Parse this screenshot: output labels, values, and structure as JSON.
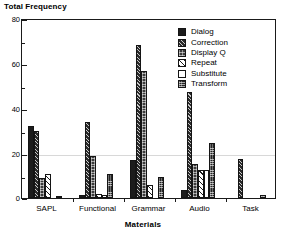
{
  "chart_data": {
    "type": "bar",
    "title": "Total Frequency",
    "subtitle": "",
    "xlabel": "Materials",
    "ylabel": "Total Frequency",
    "categories": [
      "SAPL",
      "Functional",
      "Grammar",
      "Audio",
      "Task"
    ],
    "series": [
      {
        "name": "Dialog",
        "pattern": "solid-dark",
        "values": [
          32,
          1.5,
          17,
          3.5,
          0
        ]
      },
      {
        "name": "Correction",
        "pattern": "hatch-fwd",
        "values": [
          30,
          34,
          68,
          47,
          17.5
        ]
      },
      {
        "name": "Display Q",
        "pattern": "stipple",
        "values": [
          9,
          18.5,
          56.5,
          15,
          0
        ]
      },
      {
        "name": "Repeat",
        "pattern": "hatch-wide",
        "values": [
          10.5,
          2,
          6,
          12.5,
          0
        ]
      },
      {
        "name": "Substitute",
        "pattern": "empty",
        "values": [
          0,
          1.5,
          0,
          12.5,
          0
        ]
      },
      {
        "name": "Transform",
        "pattern": "checker",
        "values": [
          1,
          10.5,
          9.5,
          24.5,
          1.5
        ]
      }
    ],
    "ylim": [
      0,
      80
    ],
    "yticks": [
      0,
      20,
      40,
      60,
      80
    ],
    "ytick_labels": [
      "0",
      "20",
      "40",
      "60",
      "80"
    ],
    "yminor_ticks": [
      10,
      30,
      50,
      70
    ],
    "grid": true,
    "gridlines_at": [
      20
    ],
    "legend_position": "top-right",
    "legend_entries": [
      "Dialog",
      "Correction",
      "Display Q",
      "Repeat",
      "Substitute",
      "Transform"
    ],
    "colors": {
      "axis": "#1a1a1a",
      "bar_outline": "#141414",
      "gridline": "#d8d8d8",
      "background": "#ffffff",
      "text": "#000000"
    }
  }
}
